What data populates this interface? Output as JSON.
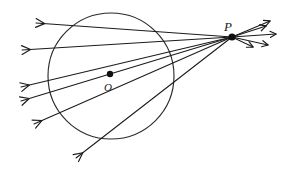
{
  "diagram": {
    "type": "geometry-line-diagram",
    "background_color": "#ffffff",
    "stroke_color": "#1b1b1b",
    "canvas": {
      "width": 281,
      "height": 172
    },
    "labels": {
      "point_p": "P",
      "point_o": "O"
    },
    "label_positions": {
      "point_p": {
        "x": 224,
        "y": 31
      },
      "point_o": {
        "x": 104,
        "y": 91
      }
    },
    "circle": {
      "name": "main-circle",
      "center": {
        "x": 111,
        "y": 76
      },
      "radius": 63,
      "stroke_width": 1.1,
      "fill": "none"
    },
    "center_dot": {
      "name": "center-point-o",
      "x": 110,
      "y": 74,
      "radius": 3.2
    },
    "external_point": {
      "name": "external-point-p",
      "x": 232,
      "y": 37,
      "radius": 3.6
    },
    "rays": [
      {
        "id": "ray-1",
        "from": {
          "x": 232,
          "y": 37
        },
        "to": {
          "x": 36,
          "y": 23
        },
        "arrow": "left-end"
      },
      {
        "id": "ray-2",
        "from": {
          "x": 232,
          "y": 37
        },
        "to": {
          "x": 22,
          "y": 50
        },
        "arrow": "left-end"
      },
      {
        "id": "ray-3",
        "from": {
          "x": 232,
          "y": 37
        },
        "to": {
          "x": 21,
          "y": 87
        },
        "arrow": "left-end"
      },
      {
        "id": "ray-4",
        "from": {
          "x": 232,
          "y": 37
        },
        "to": {
          "x": 21,
          "y": 101
        },
        "arrow": "left-end"
      },
      {
        "id": "ray-5",
        "from": {
          "x": 232,
          "y": 37
        },
        "to": {
          "x": 34,
          "y": 124
        },
        "arrow": "left-end"
      },
      {
        "id": "ray-6",
        "from": {
          "x": 232,
          "y": 37
        },
        "to": {
          "x": 76,
          "y": 158
        },
        "arrow": "left-end"
      }
    ],
    "short_rays_right": [
      {
        "id": "short-ray-1",
        "from": {
          "x": 232,
          "y": 37
        },
        "to": {
          "x": 270,
          "y": 21
        }
      },
      {
        "id": "short-ray-2",
        "from": {
          "x": 232,
          "y": 37
        },
        "to": {
          "x": 266,
          "y": 26
        }
      },
      {
        "id": "short-ray-3",
        "from": {
          "x": 232,
          "y": 37
        },
        "to": {
          "x": 276,
          "y": 34
        }
      },
      {
        "id": "short-ray-4",
        "from": {
          "x": 232,
          "y": 37
        },
        "to": {
          "x": 268,
          "y": 45
        }
      },
      {
        "id": "short-ray-5",
        "from": {
          "x": 232,
          "y": 37
        },
        "to": {
          "x": 253,
          "y": 47
        }
      }
    ],
    "counts": {
      "rays_left": 6,
      "short_rays_right": 5
    }
  }
}
